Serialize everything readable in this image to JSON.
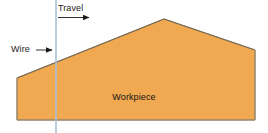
{
  "figure": {
    "type": "technical-diagram",
    "background_color": "#ffffff",
    "labels": {
      "travel": "Travel",
      "wire": "Wire",
      "workpiece": "Workpiece"
    },
    "colors": {
      "workpiece_fill": "#F0A851",
      "workpiece_outline": "#8C7A60",
      "wire_line": "#A9C0D4",
      "arrow": "#1a1a1a",
      "text": "#1a1a1a"
    },
    "geometry": {
      "canvas": {
        "width": 268,
        "height": 133
      },
      "workpiece_polygon": [
        [
          17,
          78
        ],
        [
          17,
          120
        ],
        [
          255,
          120
        ],
        [
          255,
          50
        ],
        [
          164,
          19
        ]
      ],
      "wire_line": {
        "x": 56,
        "y1": 0,
        "y2": 133
      },
      "travel_arrow": {
        "x1": 58,
        "x2": 92,
        "y": 17,
        "direction": "right"
      },
      "wire_arrow": {
        "x1": 36,
        "x2": 55,
        "y": 50,
        "direction": "right"
      }
    }
  }
}
